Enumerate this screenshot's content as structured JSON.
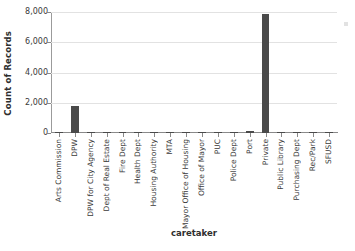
{
  "chart_data": {
    "type": "bar",
    "title": "",
    "xlabel": "caretaker",
    "ylabel": "Count of Records",
    "ylim": [
      0,
      8000
    ],
    "yticks": [
      0,
      2000,
      4000,
      6000,
      8000
    ],
    "ytick_labels": [
      "0",
      "2,000",
      "4,000",
      "6,000",
      "8,000"
    ],
    "grid": true,
    "legend": "none",
    "bar_color": "#4a4a4a",
    "gridline_color": "#e2e2e2",
    "axis_color": "#8a8a8a",
    "categories": [
      "Arts Commission",
      "DPW",
      "DPW for City Agency",
      "Dept of Real Estate",
      "Fire Dept",
      "Health Dept",
      "Housing Authority",
      "MTA",
      "Mayor Office of Housing",
      "Office of Mayor",
      "PUC",
      "Police Dept",
      "Port",
      "Private",
      "Public Library",
      "Purchasing Dept",
      "Rec/Park",
      "SFUSD"
    ],
    "values": [
      5,
      1800,
      20,
      5,
      8,
      8,
      5,
      10,
      5,
      8,
      10,
      25,
      130,
      7900,
      5,
      5,
      35,
      45
    ]
  }
}
